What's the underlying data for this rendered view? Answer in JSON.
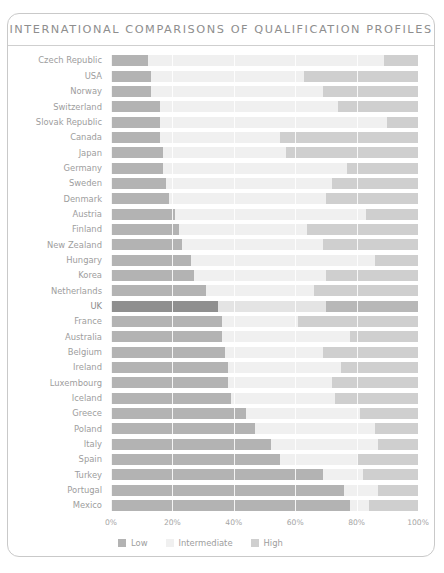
{
  "title": "INTERNATIONAL COMPARISONS OF QUALIFICATION PROFILES",
  "colors": {
    "low": "#b3b3b3",
    "intermediate": "#f0f0f0",
    "high": "#cfcfcf",
    "label": "#9d9d9d",
    "title": "#8e8e8e",
    "frame": "#c9c9c9"
  },
  "legend": {
    "position": "bottom-left",
    "items": [
      {
        "label": "Low",
        "key": "low"
      },
      {
        "label": "Intermediate",
        "key": "intermediate"
      },
      {
        "label": "High",
        "key": "high"
      }
    ]
  },
  "axis": {
    "ticks": [
      0,
      20,
      40,
      60,
      80,
      100
    ],
    "tick_labels": [
      "0%",
      "20%",
      "40%",
      "60%",
      "80%",
      "100%"
    ],
    "xlim": [
      0,
      100
    ]
  },
  "highlighted_category": "UK",
  "chart_data": {
    "type": "bar",
    "orientation": "horizontal",
    "stacked": true,
    "stacked_percent": true,
    "title": "INTERNATIONAL COMPARISONS OF QUALIFICATION PROFILES",
    "xlabel": "",
    "ylabel": "",
    "xlim": [
      0,
      100
    ],
    "grid": true,
    "legend_position": "bottom-left",
    "categories": [
      "Czech Republic",
      "USA",
      "Norway",
      "Switzerland",
      "Slovak Republic",
      "Canada",
      "Japan",
      "Germany",
      "Sweden",
      "Denmark",
      "Austria",
      "Finland",
      "New Zealand",
      "Hungary",
      "Korea",
      "Netherlands",
      "UK",
      "France",
      "Australia",
      "Belgium",
      "Ireland",
      "Luxembourg",
      "Iceland",
      "Greece",
      "Poland",
      "Italy",
      "Spain",
      "Turkey",
      "Portugal",
      "Mexico"
    ],
    "series": [
      {
        "name": "Low",
        "values": [
          12,
          13,
          13,
          16,
          16,
          16,
          17,
          17,
          18,
          19,
          21,
          22,
          23,
          26,
          27,
          31,
          35,
          36,
          36,
          37,
          38,
          38,
          39,
          44,
          47,
          52,
          55,
          69,
          76,
          78
        ]
      },
      {
        "name": "Intermediate",
        "values": [
          77,
          50,
          56,
          58,
          74,
          39,
          40,
          60,
          54,
          51,
          62,
          42,
          46,
          60,
          43,
          35,
          35,
          25,
          42,
          32,
          37,
          34,
          34,
          37,
          39,
          35,
          25,
          13,
          11,
          6
        ]
      },
      {
        "name": "High",
        "values": [
          11,
          37,
          31,
          26,
          10,
          45,
          43,
          23,
          28,
          30,
          17,
          36,
          31,
          14,
          30,
          34,
          30,
          39,
          22,
          31,
          25,
          28,
          27,
          19,
          14,
          13,
          20,
          18,
          13,
          16
        ]
      }
    ]
  }
}
